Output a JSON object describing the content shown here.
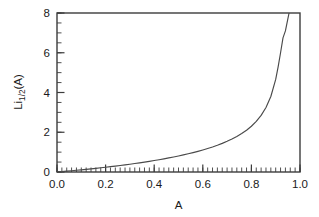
{
  "chart_data": {
    "type": "line",
    "title": "",
    "xlabel": "A",
    "ylabel": "Li1/2(A)",
    "ylabel_base": "Li",
    "ylabel_sub": "1/2",
    "ylabel_arg": "(A)",
    "xlim": [
      0.0,
      1.0
    ],
    "ylim": [
      0.0,
      8.0
    ],
    "grid": false,
    "legend": "none",
    "x_major_ticks": [
      0.0,
      0.2,
      0.4,
      0.6,
      0.8,
      1.0
    ],
    "x_major_tick_labels": [
      "0.0",
      "0.2",
      "0.4",
      "0.6",
      "0.8",
      "1.0"
    ],
    "x_minor_tick_step": 0.02,
    "y_major_ticks": [
      0,
      2,
      4,
      6,
      8
    ],
    "y_major_tick_labels": [
      "0",
      "2",
      "4",
      "6",
      "8"
    ],
    "y_minor_tick_step": 0.5,
    "line_color": "#4a4a4a",
    "frame_color": "#3c3c3c",
    "background_color": "#ffffff",
    "series": [
      {
        "name": "Li_1/2(A)",
        "x": [
          0.0,
          0.02,
          0.04,
          0.06,
          0.08,
          0.1,
          0.12,
          0.14,
          0.16,
          0.18,
          0.2,
          0.22,
          0.24,
          0.26,
          0.28,
          0.3,
          0.32,
          0.34,
          0.36,
          0.38,
          0.4,
          0.42,
          0.44,
          0.46,
          0.48,
          0.5,
          0.52,
          0.54,
          0.56,
          0.58,
          0.6,
          0.62,
          0.64,
          0.66,
          0.68,
          0.7,
          0.72,
          0.74,
          0.76,
          0.78,
          0.8,
          0.82,
          0.84,
          0.86,
          0.88,
          0.9,
          0.91,
          0.92,
          0.93,
          0.94,
          0.95,
          0.955
        ],
        "y": [
          0.0,
          0.0206,
          0.0419,
          0.0639,
          0.0866,
          0.11,
          0.1342,
          0.1591,
          0.1849,
          0.2115,
          0.239,
          0.2675,
          0.2969,
          0.3274,
          0.359,
          0.3918,
          0.4258,
          0.4612,
          0.498,
          0.5363,
          0.5763,
          0.6181,
          0.6618,
          0.7076,
          0.7557,
          0.8063,
          0.8597,
          0.9162,
          0.9761,
          1.0399,
          1.1081,
          1.1813,
          1.2603,
          1.3461,
          1.4398,
          1.543,
          1.6576,
          1.7864,
          1.9329,
          2.1023,
          2.3021,
          2.5441,
          2.8473,
          3.2441,
          3.7984,
          4.6563,
          5.2862,
          6.0,
          6.75,
          7.1,
          7.7,
          8.0
        ]
      }
    ],
    "annotation": "Li_1/2(A) diverges as A approaches 1"
  },
  "figure": {
    "background": "#ffffff"
  }
}
